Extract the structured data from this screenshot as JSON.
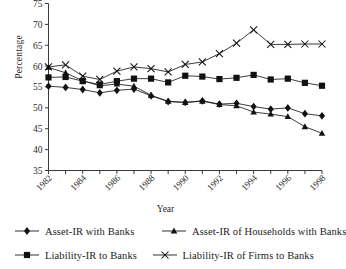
{
  "chart_data": {
    "type": "line",
    "title": "",
    "xlabel": "Year",
    "ylabel": "Percentage",
    "ylim": [
      35,
      75
    ],
    "yticks": [
      35,
      40,
      45,
      50,
      55,
      60,
      65,
      70,
      75
    ],
    "xlim": [
      1982,
      1998
    ],
    "x": [
      1982,
      1983,
      1984,
      1985,
      1986,
      1987,
      1988,
      1989,
      1990,
      1991,
      1992,
      1993,
      1994,
      1995,
      1996,
      1997,
      1998
    ],
    "xtick_labels": [
      "1982",
      "1984",
      "1986",
      "1988",
      "1990",
      "1992",
      "1994",
      "1996",
      "1998"
    ],
    "xticks_labeled": [
      1982,
      1984,
      1986,
      1988,
      1990,
      1992,
      1994,
      1996,
      1998
    ],
    "grid": false,
    "legend_position": "bottom",
    "series": [
      {
        "name": "Asset-IR with Banks",
        "marker": "diamond",
        "values": [
          55.2,
          54.9,
          54.4,
          53.6,
          54.2,
          54.5,
          52.9,
          51.5,
          51.3,
          51.7,
          50.9,
          51.1,
          50.3,
          49.7,
          50.0,
          48.6,
          48.1
        ]
      },
      {
        "name": "Asset-IR of Households with Banks",
        "marker": "triangle",
        "values": [
          59.7,
          58.4,
          56.5,
          55.3,
          55.7,
          55.2,
          53.0,
          51.6,
          51.3,
          51.6,
          50.8,
          50.5,
          49.0,
          48.5,
          47.9,
          45.5,
          43.9
        ]
      },
      {
        "name": "Liability-IR to Banks",
        "marker": "square",
        "values": [
          57.3,
          57.4,
          56.4,
          55.6,
          56.4,
          57.0,
          57.0,
          56.1,
          57.7,
          57.5,
          56.9,
          57.2,
          57.9,
          56.8,
          57.0,
          56.0,
          55.3
        ]
      },
      {
        "name": "Liability-IR of Firms to Banks",
        "marker": "cross",
        "values": [
          59.8,
          60.3,
          57.6,
          56.8,
          58.8,
          59.8,
          59.4,
          58.6,
          60.4,
          61.0,
          63.0,
          65.5,
          68.7,
          65.2,
          65.2,
          65.3,
          65.3
        ]
      }
    ]
  },
  "axes": {
    "ylabel": "Percentage",
    "xlabel": "Year"
  },
  "legend": {
    "items": [
      {
        "label": "Asset-IR with Banks",
        "marker": "diamond"
      },
      {
        "label": "Asset-IR of Households with Banks",
        "marker": "triangle"
      },
      {
        "label": "Liability-IR to Banks",
        "marker": "square"
      },
      {
        "label": "Liability-IR of Firms to Banks",
        "marker": "cross"
      }
    ]
  },
  "colors": {
    "ink": "#1a1a1a",
    "axis": "#3a3a3a",
    "background": "#ffffff"
  }
}
